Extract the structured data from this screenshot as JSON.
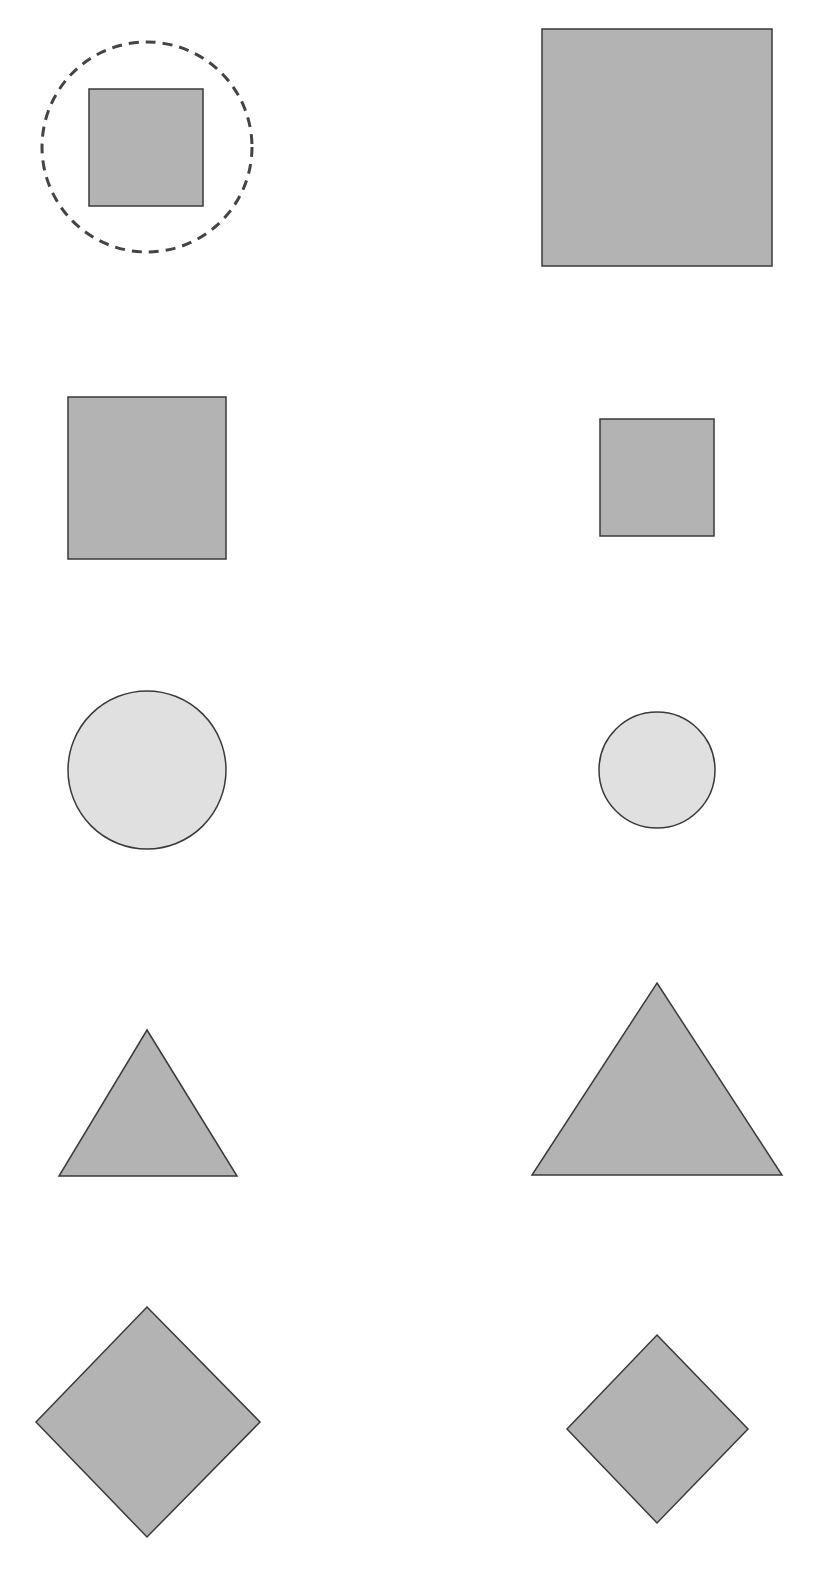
{
  "colors": {
    "background": "#ffffff",
    "shape_fill_dark": "#b3b3b3",
    "shape_fill_light": "#e0e0e0",
    "stroke": "#3a3a3a",
    "dashed_circle": "#444444"
  },
  "rows": [
    {
      "label": "square-row-1",
      "left": {
        "shape": "square",
        "x": 89,
        "y": 89,
        "w": 114,
        "h": 117,
        "fill": "dark",
        "highlighted": true
      },
      "right": {
        "shape": "square",
        "x": 542,
        "y": 29,
        "w": 230,
        "h": 237,
        "fill": "dark"
      }
    },
    {
      "label": "square-row-2",
      "left": {
        "shape": "square",
        "x": 68,
        "y": 397,
        "w": 158,
        "h": 162,
        "fill": "dark"
      },
      "right": {
        "shape": "square",
        "x": 600,
        "y": 419,
        "w": 114,
        "h": 117,
        "fill": "dark"
      }
    },
    {
      "label": "circle-row",
      "left": {
        "shape": "circle",
        "cx": 147,
        "cy": 770,
        "r": 79,
        "fill": "light"
      },
      "right": {
        "shape": "circle",
        "cx": 657,
        "cy": 770,
        "r": 58,
        "fill": "light"
      }
    },
    {
      "label": "triangle-row",
      "left": {
        "shape": "triangle",
        "points": "147,1030 237,1176 59,1176",
        "fill": "dark"
      },
      "right": {
        "shape": "triangle",
        "points": "657,983 782,1175 532,1175",
        "fill": "dark"
      }
    },
    {
      "label": "diamond-row",
      "left": {
        "shape": "diamond",
        "points": "147,1307 260,1422 147,1537 36,1422",
        "fill": "dark"
      },
      "right": {
        "shape": "diamond",
        "points": "657,1335 748,1429 657,1523 567,1429",
        "fill": "dark"
      }
    }
  ],
  "highlight": {
    "shape": "dashed-circle",
    "cx": 147,
    "cy": 147,
    "r": 105
  }
}
